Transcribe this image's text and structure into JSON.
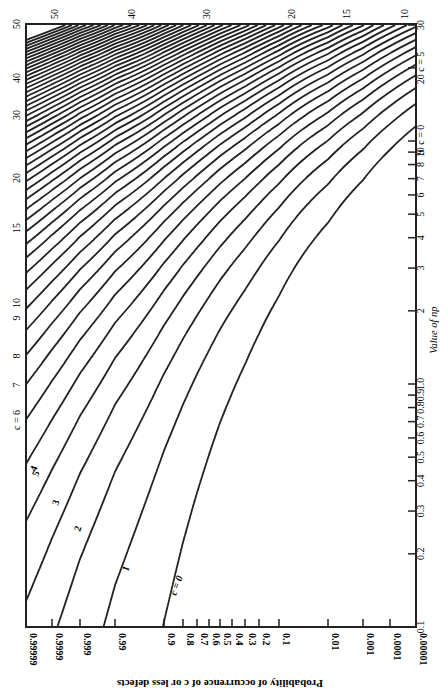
{
  "chart_data": {
    "type": "line",
    "orientation": "rotated 90° clockwise",
    "xlabel": "Value of np",
    "ylabel": "Probability of occurrence of c or less defects",
    "x_scale": "log",
    "xlim": [
      0.1,
      30
    ],
    "x_ticks": [
      "0.1",
      "0.2",
      "0.3",
      "0.4",
      "0.5",
      "0.6",
      "0.7",
      "0.8",
      "0.9",
      "1.0",
      "2",
      "3",
      "4",
      "5",
      "6",
      "7",
      "8",
      "9",
      "10",
      "20",
      "30"
    ],
    "y_scale": "probability",
    "ylim": [
      1e-05,
      0.99999
    ],
    "y_ticks": [
      "0.99999",
      "0.9999",
      "0.999",
      "0.99",
      "0.9",
      "0.8",
      "0.7",
      "0.6",
      "0.5",
      "0.4",
      "0.3",
      "0.2",
      "0.1",
      "0.01",
      "0.001",
      "0.0001",
      "0.00001"
    ],
    "series_c_values": [
      0,
      1,
      2,
      3,
      4,
      5,
      6,
      7,
      8,
      9,
      10,
      11,
      12,
      13,
      14,
      15,
      16,
      17,
      18,
      19,
      20,
      21,
      22,
      23,
      24,
      25,
      26,
      27,
      28,
      29,
      30,
      31,
      32,
      33,
      34,
      35,
      36,
      37,
      38,
      39,
      40,
      41,
      42,
      43,
      44,
      45,
      46,
      47,
      48,
      49,
      50
    ],
    "series_formula": "P(X <= c) for Poisson(np)",
    "curve_labels": [
      {
        "text": "c = 0",
        "c": 0
      },
      {
        "text": "1",
        "c": 1
      },
      {
        "text": "2",
        "c": 2
      },
      {
        "text": "3",
        "c": 3
      },
      {
        "text": "4",
        "c": 4
      },
      {
        "text": "5",
        "c": 5
      },
      {
        "text": "c = 6",
        "c": 6
      },
      {
        "text": "7",
        "c": 7
      },
      {
        "text": "8",
        "c": 8
      },
      {
        "text": "9",
        "c": 9
      },
      {
        "text": "10",
        "c": 10
      },
      {
        "text": "15",
        "c": 15
      },
      {
        "text": "20",
        "c": 20
      },
      {
        "text": "30",
        "c": 30
      },
      {
        "text": "40",
        "c": 40
      },
      {
        "text": "50",
        "c": 50
      }
    ],
    "right_edge_labels": [
      "10 c = 0",
      "20 c = 5",
      "30"
    ],
    "top_edge_labels": [
      "50",
      "40",
      "30",
      "20",
      "15",
      "10"
    ],
    "grid": false,
    "legend": "none"
  },
  "axis": {
    "xlabel": "Value of np",
    "ylabel": "Probability of occurrence of c or less defects"
  }
}
